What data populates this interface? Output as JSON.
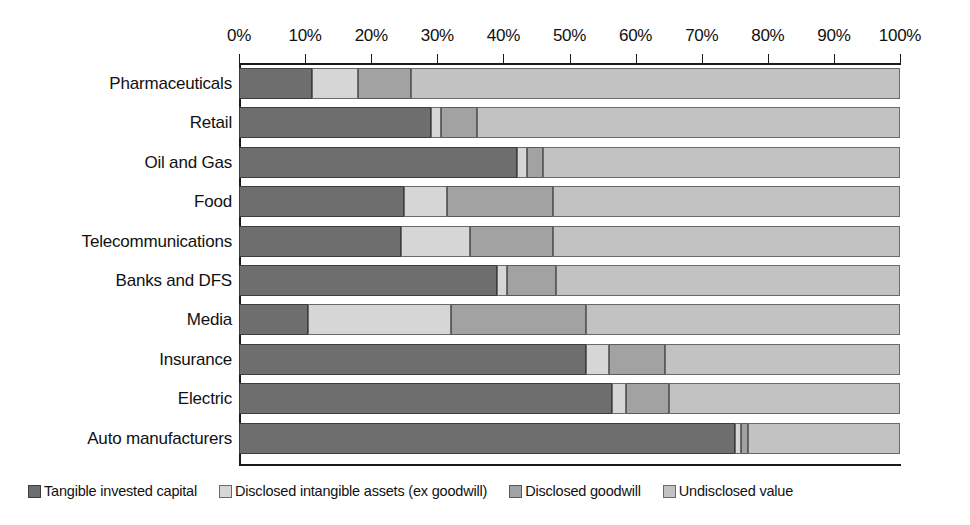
{
  "chart_data": {
    "type": "bar",
    "orientation": "horizontal",
    "stacked": true,
    "stack_mode": "percent",
    "title": "",
    "subtitle": "",
    "xlabel": "",
    "ylabel": "",
    "xlim": [
      0,
      100
    ],
    "grid": false,
    "legend_position": "bottom-left",
    "xticks": [
      0,
      10,
      20,
      30,
      40,
      50,
      60,
      70,
      80,
      90,
      100
    ],
    "xtick_labels": [
      "0%",
      "10%",
      "20%",
      "30%",
      "40%",
      "50%",
      "60%",
      "70%",
      "80%",
      "90%",
      "100%"
    ],
    "categories": [
      "Pharmaceuticals",
      "Retail",
      "Oil and Gas",
      "Food",
      "Telecommunications",
      "Banks and DFS",
      "Media",
      "Insurance",
      "Electric",
      "Auto manufacturers"
    ],
    "series": [
      {
        "name": "Tangible invested capital",
        "color": "#6e6e6e",
        "values": [
          11.0,
          29.0,
          42.0,
          25.0,
          24.5,
          39.0,
          10.5,
          52.5,
          56.5,
          75.0
        ]
      },
      {
        "name": "Disclosed intangible assets (ex goodwill)",
        "color": "#d6d6d6",
        "values": [
          7.0,
          1.5,
          1.5,
          6.5,
          10.5,
          1.5,
          21.5,
          3.5,
          2.0,
          1.0
        ]
      },
      {
        "name": "Disclosed goodwill",
        "color": "#a2a2a2",
        "values": [
          8.0,
          5.5,
          2.5,
          16.0,
          12.5,
          7.5,
          20.5,
          8.5,
          6.5,
          1.0
        ]
      },
      {
        "name": "Undisclosed value",
        "color": "#c2c2c2",
        "values": [
          74.0,
          64.0,
          54.0,
          52.5,
          52.5,
          52.0,
          47.5,
          35.5,
          35.0,
          23.0
        ]
      }
    ]
  },
  "legend": {
    "items": [
      {
        "label": "Tangible invested capital"
      },
      {
        "label": "Disclosed intangible assets (ex goodwill)"
      },
      {
        "label": "Disclosed goodwill"
      },
      {
        "label": "Undisclosed value"
      }
    ]
  }
}
